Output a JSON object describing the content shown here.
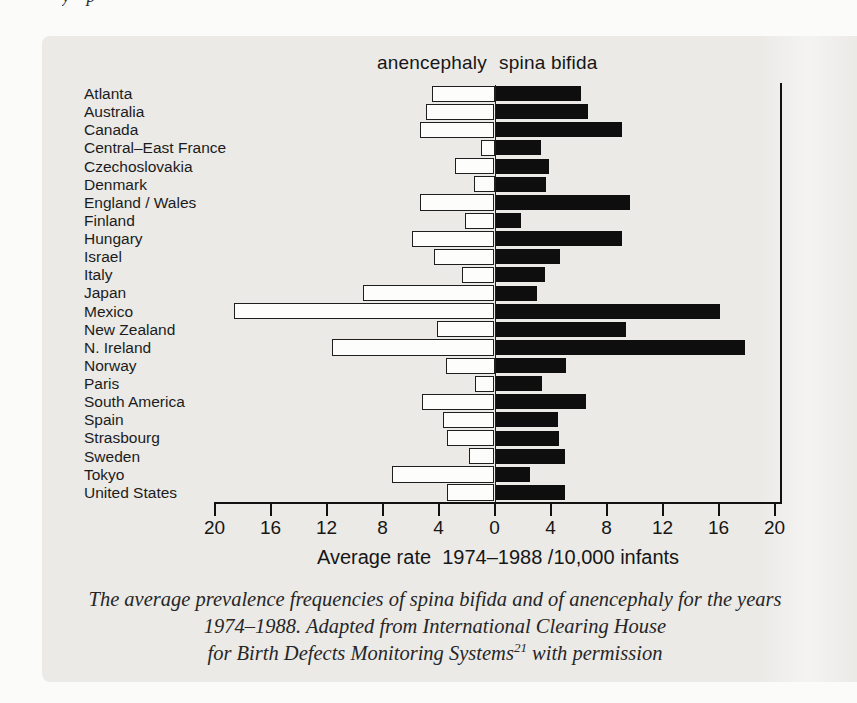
{
  "page": {
    "top_crop_artifact_text": "y p"
  },
  "legend": {
    "left_label": "anencephaly",
    "right_label": "spina bifida"
  },
  "axis": {
    "title": "Average rate  1974–1988 /10,000 infants",
    "tick_labels": [
      "20",
      "16",
      "12",
      "8",
      "4",
      "0",
      "4",
      "8",
      "12",
      "16",
      "20"
    ]
  },
  "caption": {
    "line1": "The average prevalence frequencies of spina bifida and of anencephaly for the years",
    "line2": "1974–1988. Adapted from International Clearing House",
    "line3_pre": "for Birth Defects Monitoring Systems",
    "line3_sup": "21",
    "line3_post": " with permission"
  },
  "colors": {
    "page_background": "#fbfbfa",
    "panel_background": "#ebeae7",
    "white_bar_fill": "#fdfdfc",
    "bar_outline": "#1e1e1e",
    "black_bar_fill": "#0e0e0e",
    "text": "#1f1f1f"
  },
  "chart_data": {
    "type": "bar",
    "orientation": "diverging-horizontal",
    "title": "",
    "xlabel": "Average rate 1974–1988 /10,000 infants",
    "x_axis_note": "values increase outward from central zero; left half = anencephaly, right half = spina bifida",
    "x_ticks_per_side": [
      20,
      16,
      12,
      8,
      4,
      0
    ],
    "xlim_each_side": [
      0,
      20
    ],
    "grid": false,
    "legend_position": "top-center",
    "categories": [
      "Atlanta",
      "Australia",
      "Canada",
      "Central–East France",
      "Czechoslovakia",
      "Denmark",
      "England / Wales",
      "Finland",
      "Hungary",
      "Israel",
      "Italy",
      "Japan",
      "Mexico",
      "New Zealand",
      "N. Ireland",
      "Norway",
      "Paris",
      "South America",
      "Spain",
      "Strasbourg",
      "Sweden",
      "Tokyo",
      "United States"
    ],
    "series": [
      {
        "name": "anencephaly",
        "side": "left",
        "fill": "white",
        "values": [
          4.5,
          4.9,
          5.3,
          1.0,
          2.8,
          1.5,
          5.3,
          2.1,
          5.9,
          4.3,
          2.3,
          9.4,
          18.6,
          4.1,
          11.6,
          3.5,
          1.4,
          5.2,
          3.7,
          3.4,
          1.8,
          7.3,
          3.4
        ]
      },
      {
        "name": "spina bifida",
        "side": "right",
        "fill": "black",
        "values": [
          6.1,
          6.6,
          9.0,
          3.2,
          3.8,
          3.6,
          9.6,
          1.8,
          9.0,
          4.6,
          3.5,
          2.9,
          16.0,
          9.3,
          17.8,
          5.0,
          3.3,
          6.4,
          4.4,
          4.5,
          4.9,
          2.4,
          4.9
        ]
      }
    ]
  }
}
